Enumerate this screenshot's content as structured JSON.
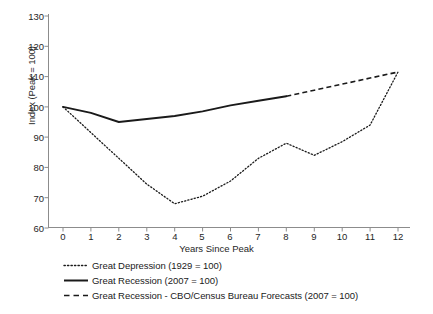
{
  "chart_data": {
    "type": "line",
    "title": "",
    "xlabel": "Years Since Peak",
    "ylabel": "Index (Peak = 100)",
    "xlim": [
      0,
      12
    ],
    "ylim": [
      60,
      130
    ],
    "xticks": [
      "0",
      "1",
      "2",
      "3",
      "4",
      "5",
      "6",
      "7",
      "8",
      "9",
      "10",
      "11",
      "12"
    ],
    "yticks": [
      "60",
      "70",
      "80",
      "90",
      "100",
      "110",
      "120",
      "130"
    ],
    "grid": false,
    "legend_position": "below",
    "x": [
      0,
      1,
      2,
      3,
      4,
      5,
      6,
      7,
      8,
      9,
      10,
      11,
      12
    ],
    "series": [
      {
        "name": "Great Depression (1929 = 100)",
        "style": "dotted",
        "color": "#1a1a1a",
        "x": [
          0,
          1,
          2,
          3,
          4,
          5,
          6,
          7,
          8,
          9,
          10,
          11,
          12
        ],
        "values": [
          100,
          91.5,
          83,
          74.5,
          68,
          70.5,
          75.5,
          83,
          88,
          84,
          88.5,
          94,
          111.5
        ]
      },
      {
        "name": "Great Recession (2007 = 100)",
        "style": "solid",
        "color": "#1a1a1a",
        "x": [
          0,
          1,
          2,
          3,
          4,
          5,
          6,
          7,
          8
        ],
        "values": [
          100,
          98,
          95,
          96,
          97,
          98.5,
          100.5,
          102,
          103.5
        ]
      },
      {
        "name": "Great Recession - CBO/Census Bureau Forecasts (2007 = 100)",
        "style": "dashed",
        "color": "#1a1a1a",
        "x": [
          8,
          9,
          10,
          11,
          12
        ],
        "values": [
          103.5,
          105.5,
          107.5,
          109.5,
          111.5
        ]
      }
    ]
  },
  "axis": {
    "ylabel": "Index (Peak = 100)",
    "xlabel": "Years Since Peak",
    "yticks": [
      "130",
      "120",
      "110",
      "100",
      "90",
      "80",
      "70",
      "60"
    ],
    "xticks": [
      "0",
      "1",
      "2",
      "3",
      "4",
      "5",
      "6",
      "7",
      "8",
      "9",
      "10",
      "11",
      "12"
    ]
  },
  "legend": {
    "items": [
      {
        "label": "Great Depression (1929 = 100)",
        "key": "dotted-line-key"
      },
      {
        "label": "Great Recession (2007 = 100)",
        "key": "solid-line-key"
      },
      {
        "label": "Great Recession - CBO/Census Bureau Forecasts (2007 = 100)",
        "key": "dashed-line-key"
      }
    ]
  },
  "colors": {
    "line": "#1a1a1a",
    "axis": "#808080",
    "background": "#ffffff"
  }
}
